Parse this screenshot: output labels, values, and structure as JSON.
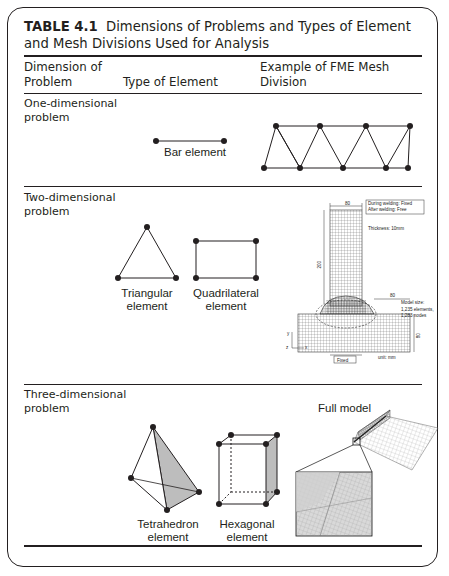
{
  "table": {
    "number": "TABLE 4.1",
    "title": "Dimensions of Problems and Types of Element and Mesh Divisions Used for Analysis",
    "columns": [
      "Dimension of Problem",
      "Type of Element",
      "Example of FME Mesh Division"
    ],
    "column_lines": {
      "c1": [
        "Dimension of",
        "Problem"
      ],
      "c2": "Type of Element",
      "c3": [
        "Example of FME Mesh",
        "Division"
      ]
    },
    "rows": [
      {
        "dimension": [
          "One-dimensional",
          "problem"
        ],
        "elements": [
          {
            "label": [
              "Bar element"
            ]
          }
        ],
        "mesh": "truss-triangle-mesh"
      },
      {
        "dimension": [
          "Two-dimensional",
          "problem"
        ],
        "elements": [
          {
            "label": [
              "Triangular",
              "element"
            ]
          },
          {
            "label": [
              "Quadrilateral",
              "element"
            ]
          }
        ],
        "mesh_annotations": {
          "dim_top": "80",
          "during_welding": "During welding: Fixed",
          "after_welding": "After welding:   Free",
          "thickness": "Thickness: 10mm",
          "dim_left": "200",
          "dim_mid": "80",
          "model_size": "Model size:",
          "elements": "1,235 elements,",
          "nodes": "1,283 nodes",
          "dim_right": "80",
          "unit": "unit: mm",
          "fixed": "Fixed",
          "axis_y": "y",
          "axis_z": "z",
          "axis_x": "x"
        }
      },
      {
        "dimension": [
          "Three-dimensional",
          "problem"
        ],
        "elements": [
          {
            "label": [
              "Tetrahedron",
              "element"
            ]
          },
          {
            "label": [
              "Hexagonal",
              "element"
            ]
          }
        ],
        "mesh_annotations": {
          "full_model": "Full model"
        }
      }
    ]
  }
}
